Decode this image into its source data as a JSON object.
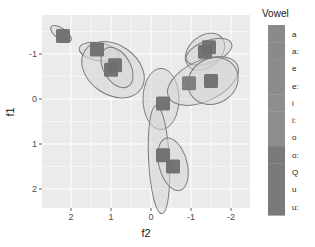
{
  "chart_data": {
    "type": "scatter",
    "title": "",
    "xlabel": "f2",
    "ylabel": "f1",
    "x_reversed": true,
    "y_reversed": true,
    "xlim": [
      2.7,
      -2.5
    ],
    "ylim": [
      -1.85,
      2.45
    ],
    "x_ticks": [
      2,
      1,
      0,
      -1,
      -2
    ],
    "x_tick_labels": [
      "2",
      "1",
      "0",
      "-1",
      "-2"
    ],
    "y_ticks": [
      -1,
      0,
      1,
      2
    ],
    "y_tick_labels": [
      "-1",
      "0",
      "1",
      "2"
    ],
    "grid": true,
    "marker": "square",
    "legend": {
      "title": "Vowel",
      "position": "right",
      "entries": [
        "a",
        "a:",
        "e",
        "e:",
        "i",
        "i:",
        "o",
        "o:",
        "Q",
        "u",
        "u:"
      ],
      "colors": [
        "#8a8a8a",
        "#8a8a8a",
        "#8c8c8c",
        "#8c8c8c",
        "#8e8e8e",
        "#8e8e8e",
        "#8e8e8e",
        "#7a7a7a",
        "#7a7a7a",
        "#7a7a7a",
        "#7a7a7a"
      ]
    },
    "points": [
      {
        "label": "a",
        "f2": -0.3,
        "f1": 1.25,
        "color": "#6e6e6e"
      },
      {
        "label": "a:",
        "f2": -0.55,
        "f1": 1.5,
        "color": "#6e6e6e"
      },
      {
        "label": "e",
        "f2": -0.95,
        "f1": -0.35,
        "color": "#7a7a7a"
      },
      {
        "label": "e:",
        "f2": -1.5,
        "f1": -0.4,
        "color": "#6e6e6e"
      },
      {
        "label": "i",
        "f2": -1.35,
        "f1": -1.05,
        "color": "#6e6e6e"
      },
      {
        "label": "i:",
        "f2": -1.45,
        "f1": -1.15,
        "color": "#6e6e6e"
      },
      {
        "label": "o",
        "f2": 1.0,
        "f1": -0.65,
        "color": "#6e6e6e"
      },
      {
        "label": "o:",
        "f2": 0.9,
        "f1": -0.75,
        "color": "#6e6e6e"
      },
      {
        "label": "Q",
        "f2": -0.3,
        "f1": 0.1,
        "color": "#6e6e6e"
      },
      {
        "label": "u",
        "f2": 1.35,
        "f1": -1.1,
        "color": "#6e6e6e"
      },
      {
        "label": "u:",
        "f2": 2.2,
        "f1": -1.4,
        "color": "#6e6e6e"
      }
    ],
    "ellipses": [
      {
        "label": "u:",
        "cx": 2.25,
        "cy": -1.45,
        "rx": 0.3,
        "ry": 0.12,
        "angle": 35
      },
      {
        "label": "u",
        "cx": 1.3,
        "cy": -1.05,
        "rx": 0.5,
        "ry": 0.2,
        "angle": 10
      },
      {
        "label": "o",
        "cx": 0.95,
        "cy": -0.65,
        "rx": 0.85,
        "ry": 0.55,
        "angle": 35
      },
      {
        "label": "o:",
        "cx": 0.85,
        "cy": -0.7,
        "rx": 0.55,
        "ry": 0.3,
        "angle": 60
      },
      {
        "label": "Q",
        "cx": -0.25,
        "cy": 0.0,
        "rx": 0.45,
        "ry": 0.68,
        "angle": 0
      },
      {
        "label": "a",
        "cx": -0.2,
        "cy": 1.35,
        "rx": 0.26,
        "ry": 1.2,
        "angle": -3
      },
      {
        "label": "a:",
        "cx": -0.55,
        "cy": 1.45,
        "rx": 0.35,
        "ry": 0.6,
        "angle": -15
      },
      {
        "label": "i",
        "cx": -1.35,
        "cy": -1.05,
        "rx": 0.55,
        "ry": 0.35,
        "angle": -40
      },
      {
        "label": "i:",
        "cx": -1.45,
        "cy": -1.05,
        "rx": 0.6,
        "ry": 0.25,
        "angle": -20
      },
      {
        "label": "e",
        "cx": -1.3,
        "cy": -0.4,
        "rx": 0.95,
        "ry": 0.45,
        "angle": -25
      },
      {
        "label": "e:",
        "cx": -1.55,
        "cy": -0.4,
        "rx": 0.65,
        "ry": 0.5,
        "angle": -30
      }
    ],
    "colors": {
      "panel_background": "#ebebeb",
      "grid": "#ffffff",
      "ellipse_fill": "#d5d5d5",
      "ellipse_stroke": "#7d7d7d",
      "point": "#6e6e6e"
    }
  }
}
